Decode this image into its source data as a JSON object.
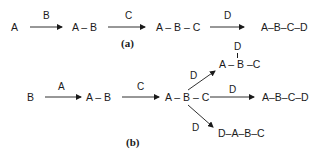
{
  "diagram": {
    "panel_a": {
      "caption": "(a)",
      "nodes": [
        "A",
        "A – B",
        "A – B – C",
        "A–B–C–D"
      ],
      "reagents": [
        "B",
        "C",
        "D"
      ]
    },
    "panel_b": {
      "caption": "(b)",
      "nodes": {
        "start": "B",
        "step1": "A – B",
        "step2": "A – B – C",
        "product_branched": "A – B –C",
        "product_branched_substituent": "D",
        "product_linear": "A–B–C–D",
        "product_prepended": "D–A–B–C"
      },
      "reagents": {
        "step1": "A",
        "step2": "C",
        "branch_up": "D",
        "branch_mid": "D",
        "branch_down": "D"
      }
    },
    "colors": {
      "ink": "#1a1a1a",
      "background": "#ffffff"
    }
  }
}
